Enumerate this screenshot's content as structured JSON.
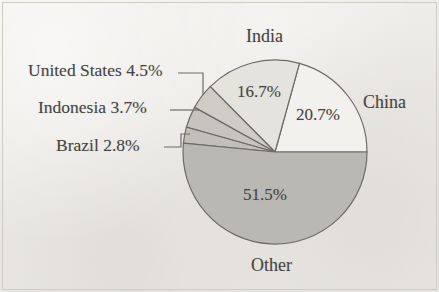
{
  "chart_data": {
    "type": "pie",
    "title": "",
    "subtitle": "",
    "xlabel": "",
    "ylabel": "",
    "legend_position": "none",
    "grid": false,
    "label_style": "in-slice percentages with external category names and leader lines",
    "start_angle_deg": 0,
    "direction": "counterclockwise",
    "total_percent": 99.9,
    "categories": [
      "China",
      "India",
      "United States",
      "Indonesia",
      "Brazil",
      "Other"
    ],
    "values": [
      20.7,
      16.7,
      4.5,
      3.7,
      2.8,
      51.5
    ],
    "slices": [
      {
        "name": "China",
        "value": 20.7,
        "value_label": "20.7%",
        "name_label": "China",
        "color": "#f3f1ee",
        "label_placement": "inside",
        "name_placement": "right-outside",
        "has_leader_line": false
      },
      {
        "name": "India",
        "value": 16.7,
        "value_label": "16.7%",
        "name_label": "India",
        "color": "#e5e3de",
        "label_placement": "inside",
        "name_placement": "top-outside",
        "has_leader_line": false
      },
      {
        "name": "United States",
        "value": 4.5,
        "value_label": "",
        "name_label": "United States 4.5%",
        "color": "#cfccc6",
        "label_placement": "outside",
        "name_placement": "left-outside",
        "has_leader_line": true
      },
      {
        "name": "Indonesia",
        "value": 3.7,
        "value_label": "",
        "name_label": "Indonesia 3.7%",
        "color": "#c7c4be",
        "label_placement": "outside",
        "name_placement": "left-outside",
        "has_leader_line": true
      },
      {
        "name": "Brazil",
        "value": 2.8,
        "value_label": "",
        "name_label": "Brazil 2.8%",
        "color": "#c2bfb9",
        "label_placement": "outside",
        "name_placement": "left-outside",
        "has_leader_line": true
      },
      {
        "name": "Other",
        "value": 51.5,
        "value_label": "51.5%",
        "name_label": "Other",
        "color": "#bab8b3",
        "label_placement": "inside",
        "name_placement": "bottom-outside",
        "has_leader_line": false
      }
    ]
  },
  "labels": {
    "india": "India",
    "china": "China",
    "other": "Other",
    "united_states": "United States 4.5%",
    "indonesia": "Indonesia 3.7%",
    "brazil": "Brazil 2.8%",
    "india_value": "16.7%",
    "china_value": "20.7%",
    "other_value": "51.5%"
  },
  "style": {
    "background": "#efedea",
    "outline": "#6e6b66",
    "text": "#474542"
  }
}
